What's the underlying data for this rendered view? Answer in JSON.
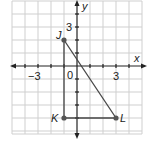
{
  "diagram": {
    "type": "coordinate-plane",
    "grid": {
      "xmin": -5,
      "xmax": 5,
      "ymin": -5,
      "ymax": 5,
      "unit_px": 13,
      "origin_px": [
        77,
        66
      ]
    },
    "axes": {
      "x_label": "x",
      "y_label": "y"
    },
    "tick_labels": {
      "x_neg": "−3",
      "x_pos": "3",
      "origin": "0",
      "y_pos": "3"
    },
    "points": [
      {
        "name": "J",
        "x": -1,
        "y": 2
      },
      {
        "name": "K",
        "x": -1,
        "y": -4
      },
      {
        "name": "L",
        "x": 3,
        "y": -4
      }
    ],
    "segments": [
      [
        "J",
        "K"
      ],
      [
        "K",
        "L"
      ],
      [
        "L",
        "J"
      ]
    ],
    "colors": {
      "grid": "#c8c8c8",
      "axis": "#222222",
      "shape": "#444444",
      "point": "#555555"
    }
  }
}
